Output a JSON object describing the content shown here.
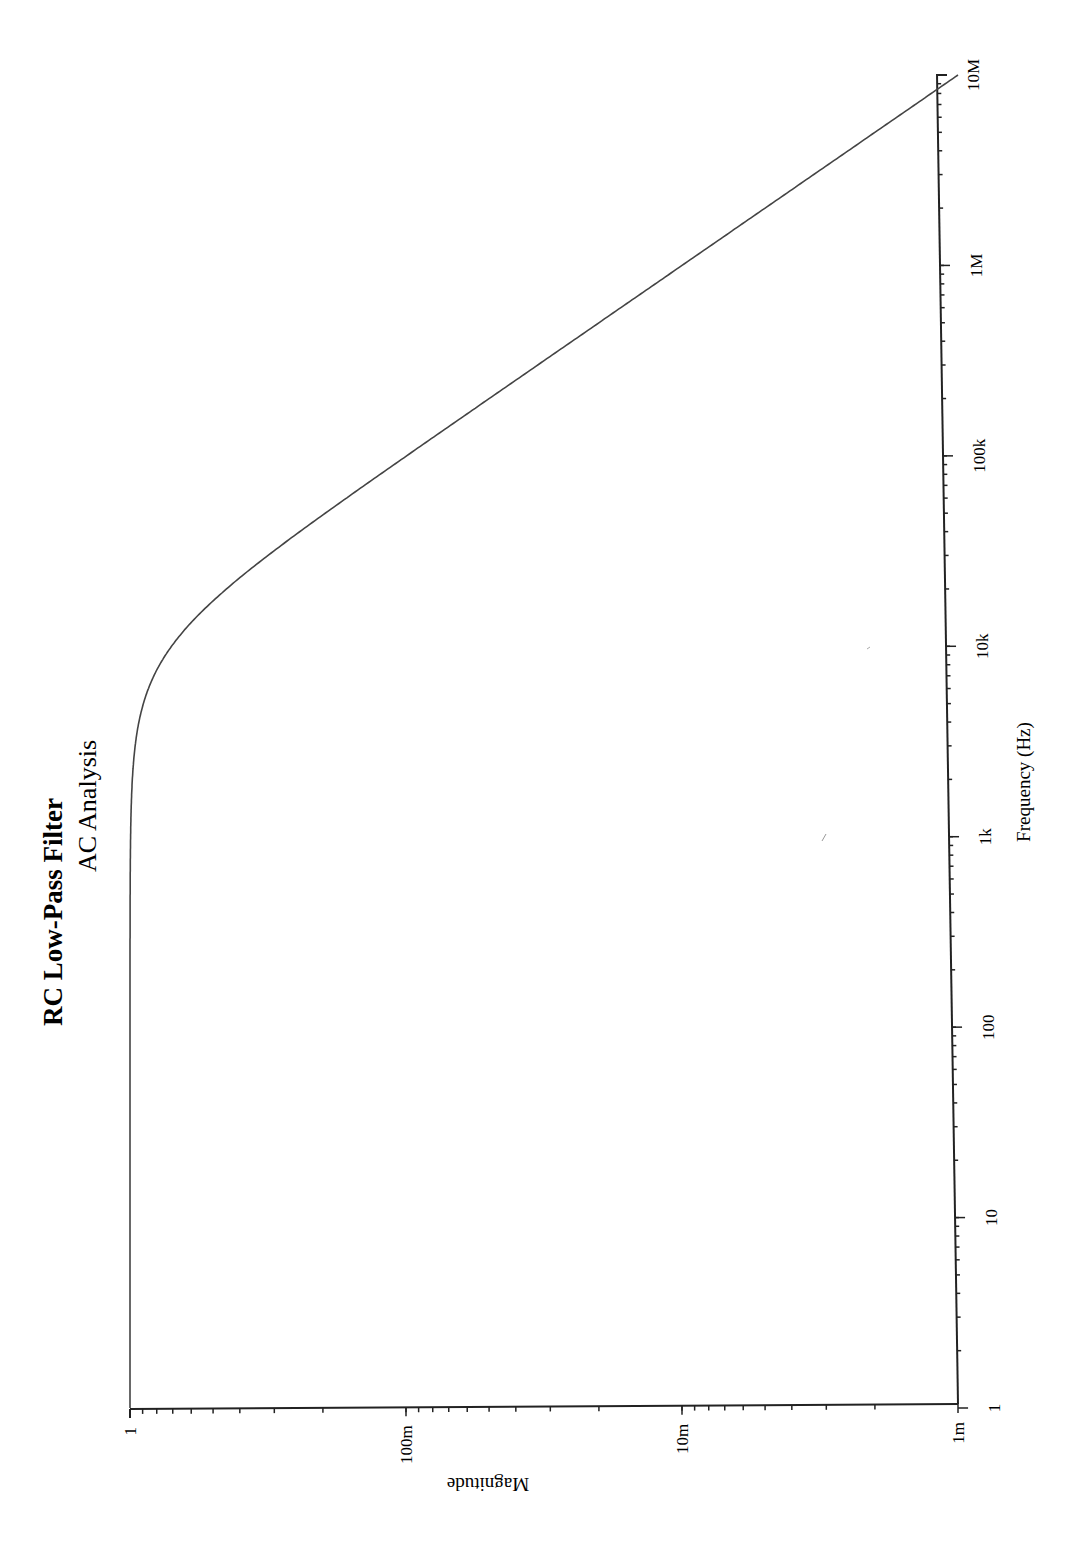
{
  "page": {
    "orientation": "rotated-90-clockwise",
    "background": "#ffffff",
    "ink_color": "#222222"
  },
  "chart_data": {
    "type": "line",
    "title": "RC Low-Pass Filter",
    "subtitle": "AC Analysis",
    "xlabel": "Frequency (Hz)",
    "ylabel": "Magnitude",
    "xscale": "log",
    "yscale": "log",
    "xlim": [
      1,
      10000000
    ],
    "ylim": [
      0.001,
      1
    ],
    "x_ticks": [
      1,
      10,
      100,
      1000,
      10000,
      100000,
      1000000,
      10000000
    ],
    "x_tick_labels": [
      "1",
      "10",
      "100",
      "1k",
      "10k",
      "100k",
      "1M",
      "10M"
    ],
    "y_ticks": [
      1,
      0.1,
      0.01,
      0.001
    ],
    "y_tick_labels": [
      "1",
      "100m",
      "10m",
      "1m"
    ],
    "grid": false,
    "legend": null,
    "series": [
      {
        "name": "Magnitude",
        "color": "#444444",
        "x": [
          1,
          10,
          100,
          1000,
          2000,
          5000,
          10000,
          20000,
          50000,
          100000,
          1000000,
          10000000
        ],
        "values": [
          1.0,
          1.0,
          1.0,
          0.995,
          0.981,
          0.894,
          0.707,
          0.447,
          0.196,
          0.0995,
          0.01,
          0.001
        ]
      }
    ],
    "cutoff_frequency_hz_estimate": 10000
  }
}
